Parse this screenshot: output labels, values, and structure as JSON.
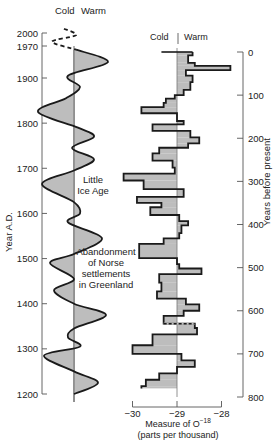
{
  "chart_data": [
    {
      "type": "line",
      "title": "Temperature oscillation (schematic)",
      "ylabel": "Year A.D.",
      "header": {
        "cold": "Cold",
        "warm": "Warm"
      },
      "y_ticks": [
        2000,
        1970,
        1900,
        1800,
        1700,
        1600,
        1500,
        1400,
        1300,
        1200
      ],
      "ylim": [
        1200,
        2000
      ],
      "x_meaning": "negative = cold, positive = warm (relative amplitude)",
      "dashed_segment": {
        "from_year": 2000,
        "to_year": 1960
      },
      "points": [
        {
          "year": 2010,
          "v": -0.5
        },
        {
          "year": 1995,
          "v": 0.1
        },
        {
          "year": 1980,
          "v": -1.1
        },
        {
          "year": 1962,
          "v": 0.1
        },
        {
          "year": 1935,
          "v": 1.7
        },
        {
          "year": 1905,
          "v": -0.3
        },
        {
          "year": 1880,
          "v": 0.3
        },
        {
          "year": 1855,
          "v": -0.4
        },
        {
          "year": 1825,
          "v": -1.8
        },
        {
          "year": 1790,
          "v": 0.2
        },
        {
          "year": 1770,
          "v": 1.0
        },
        {
          "year": 1745,
          "v": -0.1
        },
        {
          "year": 1720,
          "v": 1.0
        },
        {
          "year": 1695,
          "v": 0.0
        },
        {
          "year": 1665,
          "v": -1.6
        },
        {
          "year": 1625,
          "v": 0.0
        },
        {
          "year": 1600,
          "v": 0.3
        },
        {
          "year": 1580,
          "v": -0.3
        },
        {
          "year": 1545,
          "v": 1.4
        },
        {
          "year": 1510,
          "v": 0.0
        },
        {
          "year": 1490,
          "v": -1.2
        },
        {
          "year": 1455,
          "v": 0.0
        },
        {
          "year": 1430,
          "v": -1.0
        },
        {
          "year": 1400,
          "v": 0.0
        },
        {
          "year": 1375,
          "v": 1.6
        },
        {
          "year": 1345,
          "v": 0.0
        },
        {
          "year": 1325,
          "v": -0.3
        },
        {
          "year": 1305,
          "v": 0.3
        },
        {
          "year": 1285,
          "v": -1.5
        },
        {
          "year": 1250,
          "v": 0.0
        },
        {
          "year": 1225,
          "v": 1.2
        },
        {
          "year": 1200,
          "v": 0.0
        }
      ],
      "annotations": [
        {
          "text": [
            "Little",
            "Ice Age"
          ],
          "year": 1660
        },
        {
          "text": [
            "Abandonment",
            "of Norse",
            "settlements",
            "in Greenland"
          ],
          "year": 1470
        }
      ]
    },
    {
      "type": "bar",
      "orientation": "horizontal-step",
      "title": "Oxygen-18 measure vs. years before present",
      "header": {
        "cold": "Cold",
        "warm": "Warm"
      },
      "xlabel": "Measure of O⁻¹⁸",
      "xlabel_sub": "(parts per thousand)",
      "x_ticks": [
        -30,
        -29,
        -28
      ],
      "xlim": [
        -30,
        -28
      ],
      "baseline": -29,
      "ylabel": "Years before present",
      "y_ticks": [
        0,
        100,
        200,
        300,
        400,
        500,
        600,
        700,
        800
      ],
      "ylim": [
        0,
        800
      ],
      "steps": [
        {
          "y0": 0,
          "y1": 8,
          "v": -28.65
        },
        {
          "y0": 8,
          "y1": 25,
          "v": -28.75
        },
        {
          "y0": 25,
          "y1": 32,
          "v": -28.6
        },
        {
          "y0": 32,
          "y1": 42,
          "v": -27.8
        },
        {
          "y0": 42,
          "y1": 55,
          "v": -28.8
        },
        {
          "y0": 55,
          "y1": 70,
          "v": -28.65
        },
        {
          "y0": 70,
          "y1": 88,
          "v": -28.7
        },
        {
          "y0": 88,
          "y1": 100,
          "v": -28.85
        },
        {
          "y0": 100,
          "y1": 108,
          "v": -29.05
        },
        {
          "y0": 108,
          "y1": 118,
          "v": -29.25
        },
        {
          "y0": 118,
          "y1": 128,
          "v": -29.3
        },
        {
          "y0": 128,
          "y1": 142,
          "v": -29.8
        },
        {
          "y0": 142,
          "y1": 160,
          "v": -29.0
        },
        {
          "y0": 160,
          "y1": 168,
          "v": -28.85
        },
        {
          "y0": 168,
          "y1": 183,
          "v": -29.55
        },
        {
          "y0": 183,
          "y1": 198,
          "v": -28.7
        },
        {
          "y0": 198,
          "y1": 212,
          "v": -28.5
        },
        {
          "y0": 212,
          "y1": 222,
          "v": -28.75
        },
        {
          "y0": 222,
          "y1": 235,
          "v": -29.4
        },
        {
          "y0": 235,
          "y1": 252,
          "v": -29.55
        },
        {
          "y0": 252,
          "y1": 268,
          "v": -29.1
        },
        {
          "y0": 268,
          "y1": 282,
          "v": -29.05
        },
        {
          "y0": 282,
          "y1": 298,
          "v": -30.2
        },
        {
          "y0": 298,
          "y1": 318,
          "v": -29.75
        },
        {
          "y0": 318,
          "y1": 336,
          "v": -28.85
        },
        {
          "y0": 336,
          "y1": 350,
          "v": -29.9
        },
        {
          "y0": 350,
          "y1": 360,
          "v": -29.35
        },
        {
          "y0": 360,
          "y1": 378,
          "v": -29.6
        },
        {
          "y0": 378,
          "y1": 392,
          "v": -28.95
        },
        {
          "y0": 392,
          "y1": 402,
          "v": -28.75
        },
        {
          "y0": 402,
          "y1": 420,
          "v": -28.9
        },
        {
          "y0": 420,
          "y1": 432,
          "v": -28.95
        },
        {
          "y0": 432,
          "y1": 445,
          "v": -29.3
        },
        {
          "y0": 445,
          "y1": 478,
          "v": -29.85
        },
        {
          "y0": 478,
          "y1": 492,
          "v": -29.0
        },
        {
          "y0": 492,
          "y1": 502,
          "v": -28.95
        },
        {
          "y0": 502,
          "y1": 515,
          "v": -28.45
        },
        {
          "y0": 515,
          "y1": 535,
          "v": -29.4
        },
        {
          "y0": 535,
          "y1": 555,
          "v": -29.35
        },
        {
          "y0": 555,
          "y1": 572,
          "v": -29.45
        },
        {
          "y0": 572,
          "y1": 585,
          "v": -28.8
        },
        {
          "y0": 585,
          "y1": 600,
          "v": -28.5
        },
        {
          "y0": 600,
          "y1": 612,
          "v": -28.85
        },
        {
          "y0": 612,
          "y1": 630,
          "v": -29.3
        },
        {
          "y0": 630,
          "y1": 640,
          "v": -28.6
        },
        {
          "y0": 640,
          "y1": 655,
          "v": -28.55
        },
        {
          "y0": 655,
          "y1": 680,
          "v": -29.55
        },
        {
          "y0": 680,
          "y1": 700,
          "v": -30.0
        },
        {
          "y0": 700,
          "y1": 715,
          "v": -28.9
        },
        {
          "y0": 715,
          "y1": 730,
          "v": -28.6
        },
        {
          "y0": 730,
          "y1": 745,
          "v": -29.0
        },
        {
          "y0": 745,
          "y1": 760,
          "v": -29.4
        },
        {
          "y0": 760,
          "y1": 775,
          "v": -29.7
        },
        {
          "y0": 775,
          "y1": 780,
          "v": -29.8
        }
      ],
      "dashed_segment_at": 630
    }
  ],
  "colors": {
    "fill": "#bdbdbd",
    "line": "#1a1a1a",
    "axis": "#555555",
    "text": "#222222"
  },
  "labels": {
    "left_cold": "Cold",
    "left_warm": "Warm",
    "right_cold": "Cold",
    "right_warm": "Warm",
    "left_ylabel": "Year A.D.",
    "right_ylabel": "Years before present",
    "xlabel_main": "Measure of O",
    "xlabel_sup": "−18",
    "xlabel_sub": "(parts per thousand)"
  }
}
